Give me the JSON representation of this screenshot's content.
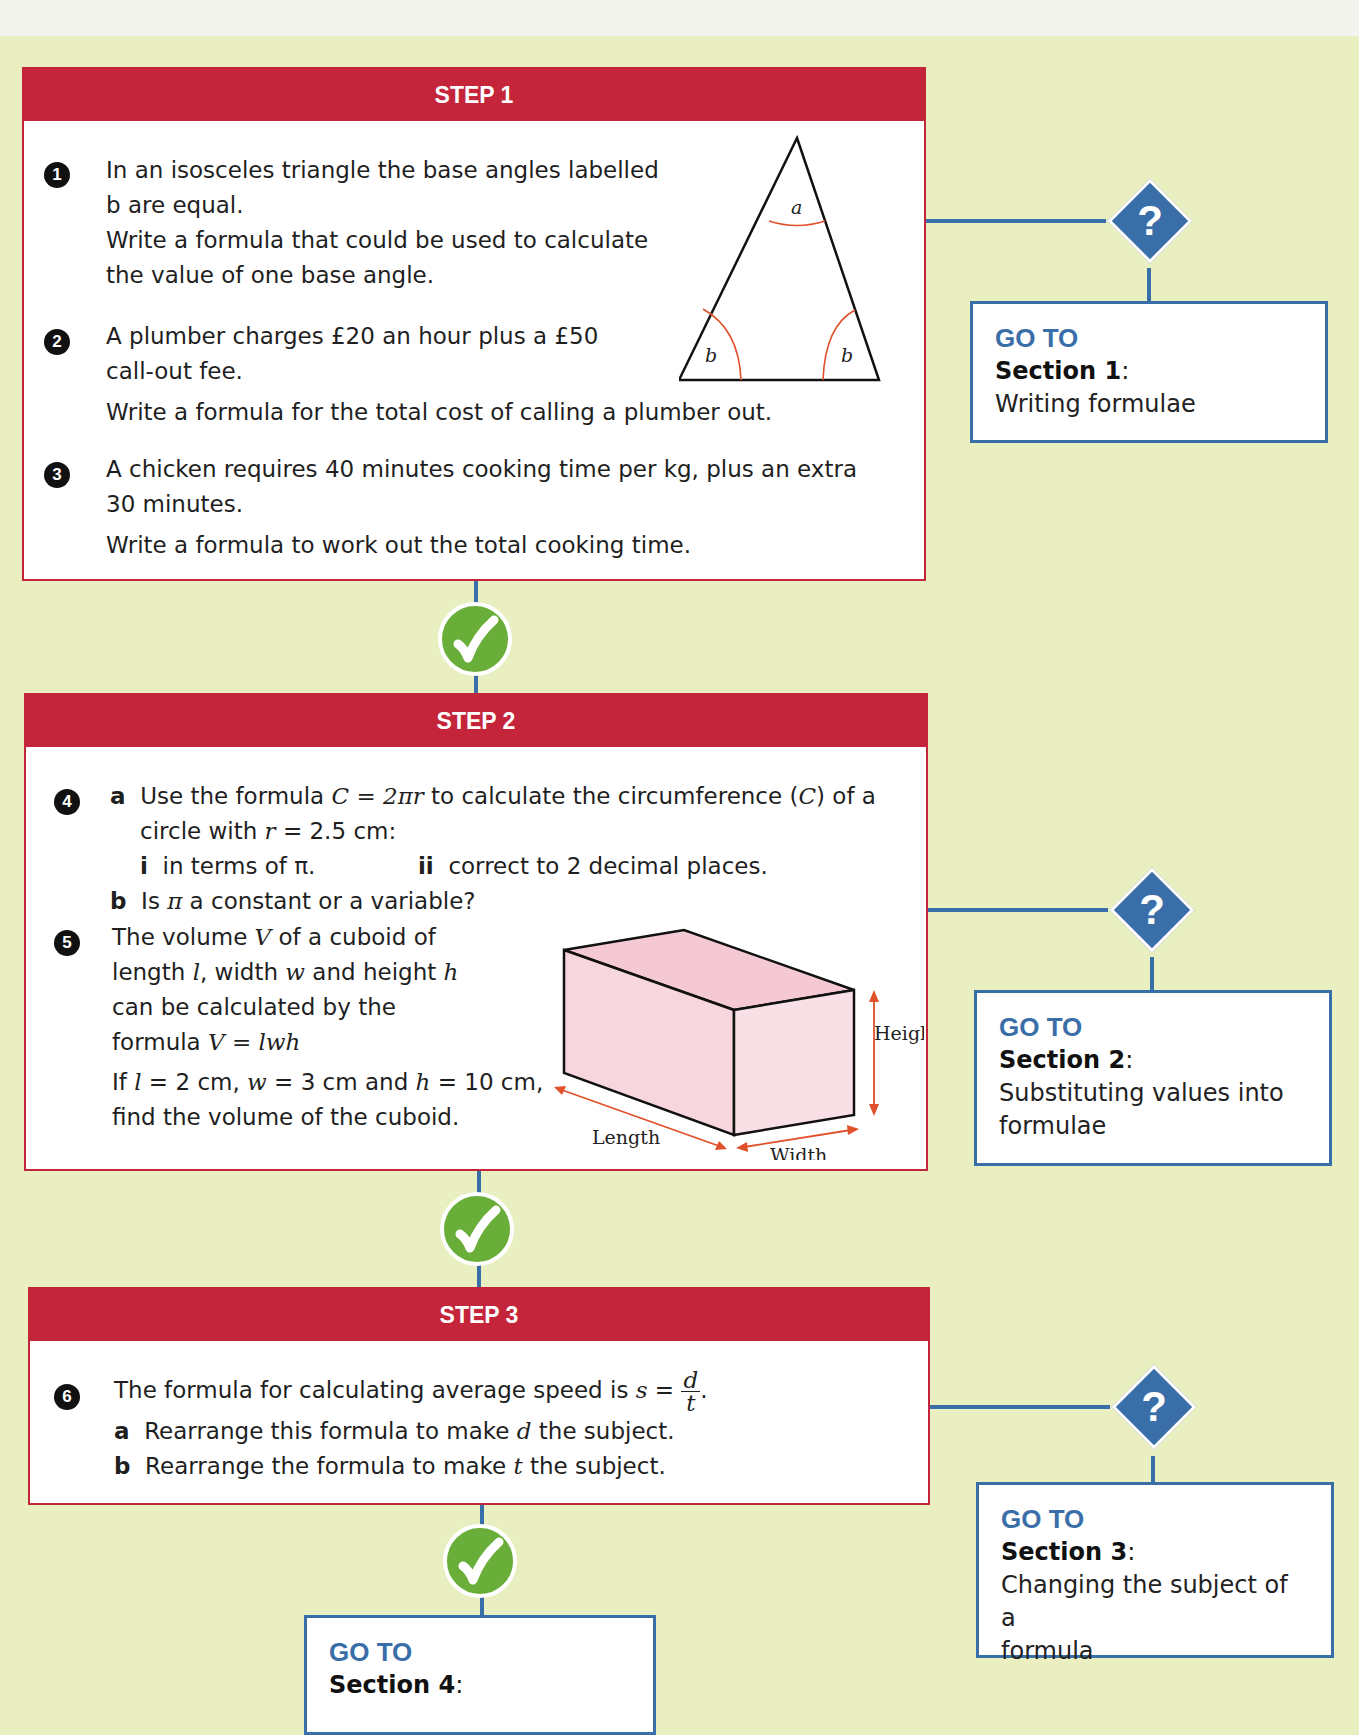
{
  "steps": [
    {
      "label": "STEP 1",
      "questions": [
        {
          "number": "1",
          "lines": [
            "In an isosceles triangle the base angles labelled",
            "b are equal.",
            "Write a formula that could be used to calculate",
            "the value of one base angle."
          ]
        },
        {
          "number": "2",
          "lines": [
            "A plumber charges £20 an hour plus a £50",
            "call-out fee.",
            "Write a formula for the total cost of calling a plumber out."
          ]
        },
        {
          "number": "3",
          "lines": [
            "A chicken requires 40 minutes cooking time per kg, plus an extra",
            "30 minutes.",
            "Write a formula to work out the total cooking time."
          ]
        }
      ],
      "diagram": {
        "type": "isosceles-triangle",
        "apex_label": "a",
        "base_labels": [
          "b",
          "b"
        ]
      },
      "goto": {
        "label": "GO TO",
        "section": "Section 1",
        "description": "Writing formulae"
      }
    },
    {
      "label": "STEP 2",
      "questions": [
        {
          "number": "4",
          "parts": {
            "a_letter": "a",
            "a_text_1": "Use the formula ",
            "a_formula": "C = 2πr",
            "a_text_2": " to calculate the circumference (",
            "a_var": "C",
            "a_text_3": ") of a",
            "a_line2_1": "circle with ",
            "a_line2_var": "r",
            "a_line2_2": " = 2.5 cm:",
            "i_label": "i",
            "i_text": "in terms of π.",
            "ii_label": "ii",
            "ii_text": "correct to 2 decimal places.",
            "b_letter": "b",
            "b_text_1": "Is ",
            "b_pi": "π",
            "b_text_2": " a constant or a variable?"
          }
        },
        {
          "number": "5",
          "lines": {
            "l1_a": "The volume ",
            "l1_var": "V",
            "l1_b": " of a cuboid of",
            "l2_a": "length ",
            "l2_l": "l",
            "l2_b": ", width ",
            "l2_w": "w",
            "l2_c": " and height ",
            "l2_h": "h",
            "l3": "can be calculated by the",
            "l4_a": "formula ",
            "l4_formula": "V = lwh",
            "l5_a": "If ",
            "l5_l": "l",
            "l5_b": " = 2 cm, ",
            "l5_w": "w",
            "l5_c": " = 3 cm and ",
            "l5_h": "h",
            "l5_d": " = 10 cm,",
            "l6": "find the volume of the cuboid."
          }
        }
      ],
      "diagram": {
        "type": "cuboid",
        "labels": {
          "height": "Height",
          "length": "Length",
          "width": "Width"
        }
      },
      "goto": {
        "label": "GO TO",
        "section": "Section 2",
        "description_1": "Substituting values into",
        "description_2": "formulae"
      }
    },
    {
      "label": "STEP 3",
      "questions": [
        {
          "number": "6",
          "text_1": "The formula for calculating average speed is ",
          "formula_lhs": "s",
          "formula_eq": " = ",
          "frac_num": "d",
          "frac_den": "t",
          "text_end": ".",
          "a_letter": "a",
          "a_text_1": "Rearrange this formula to make ",
          "a_var": "d",
          "a_text_2": " the subject.",
          "b_letter": "b",
          "b_text_1": "Rearrange the formula to make ",
          "b_var": "t",
          "b_text_2": " the subject."
        }
      ],
      "goto": {
        "label": "GO TO",
        "section": "Section 3",
        "description_1": "Changing the subject of a",
        "description_2": "formula"
      }
    }
  ],
  "final_goto": {
    "label": "GO TO",
    "section": "Section 4"
  },
  "icons": {
    "correct": "check-icon",
    "wrong": "question-icon"
  },
  "symbols": {
    "question_mark": "?",
    "colon": ":"
  },
  "colors": {
    "step_red": "#c5253a",
    "connector_blue": "#3a6ea8",
    "tick_green": "#6aae3a",
    "page_bg": "#e9efc0",
    "cuboid_pink": "#f7d6de",
    "arrow_orange": "#e0502a"
  }
}
